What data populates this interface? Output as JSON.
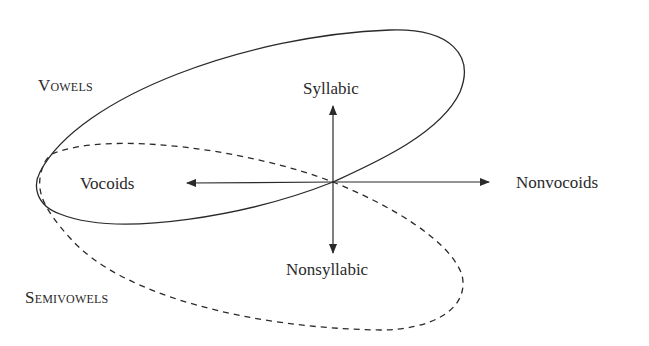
{
  "diagram": {
    "axes": {
      "up": {
        "label": "Syllabic"
      },
      "down": {
        "label": "Nonsyllabic"
      },
      "left": {
        "label": "Vocoids"
      },
      "right": {
        "label": "Nonvocoids"
      }
    },
    "regions": {
      "solid_ellipse": {
        "label": "Vowels",
        "style": "solid"
      },
      "dashed_ellipse": {
        "label": "Semivowels",
        "style": "dashed"
      }
    },
    "colors": {
      "stroke": "#2a2a2a",
      "text": "#2a2a2a",
      "background": "#ffffff"
    }
  }
}
